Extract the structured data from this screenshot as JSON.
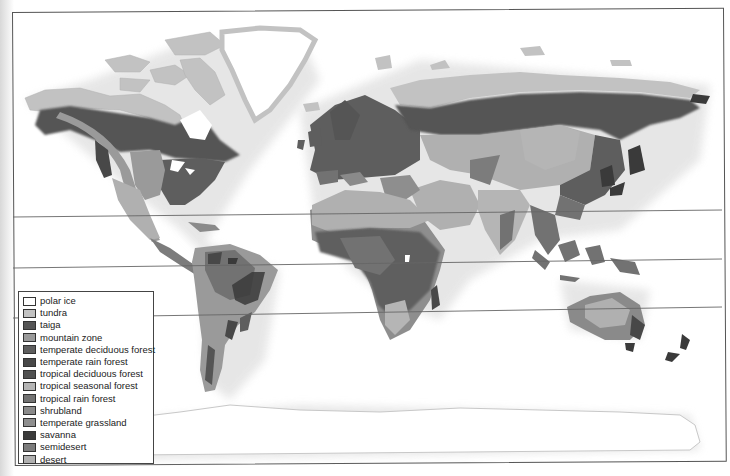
{
  "map": {
    "type": "world biome map",
    "latitude_lines": [
      {
        "name": "tropic-of-cancer-line",
        "y_left": 217,
        "y_right": 210
      },
      {
        "name": "equator-line",
        "y_left": 268,
        "y_right": 259
      },
      {
        "name": "tropic-of-capricorn-line",
        "y_left": 318,
        "y_right": 307
      }
    ]
  },
  "legend": {
    "items": [
      {
        "label": "polar ice",
        "color": "#ffffff"
      },
      {
        "label": "tundra",
        "color": "#c2c2c2"
      },
      {
        "label": "taiga",
        "color": "#555555"
      },
      {
        "label": "mountain zone",
        "color": "#9a9a9a"
      },
      {
        "label": "temperate deciduous forest",
        "color": "#5e5e5e"
      },
      {
        "label": "temperate rain forest",
        "color": "#484848"
      },
      {
        "label": "tropical deciduous forest",
        "color": "#505050"
      },
      {
        "label": "tropical seasonal forest",
        "color": "#b5b5b5"
      },
      {
        "label": "tropical rain forest",
        "color": "#727272"
      },
      {
        "label": "shrubland",
        "color": "#8a8a8a"
      },
      {
        "label": "temperate grassland",
        "color": "#8e8e8e"
      },
      {
        "label": "savanna",
        "color": "#3a3a3a"
      },
      {
        "label": "semidesert",
        "color": "#7c7c7c"
      },
      {
        "label": "desert",
        "color": "#b0b0b0"
      }
    ]
  }
}
